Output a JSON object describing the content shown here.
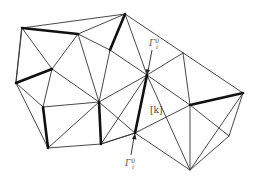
{
  "diagram": {
    "type": "triangulated-mesh",
    "labels": {
      "top_boundary_label": "Γ",
      "top_boundary_sup": "0",
      "top_boundary_sub": "i",
      "bottom_boundary_label": "Γ",
      "bottom_boundary_sup": "0",
      "bottom_boundary_sub": "i",
      "element_label": "[k]"
    },
    "colors": {
      "edge": "#333333",
      "thick_edge": "#111111",
      "label": "#555555",
      "background": "#ffffff"
    }
  }
}
